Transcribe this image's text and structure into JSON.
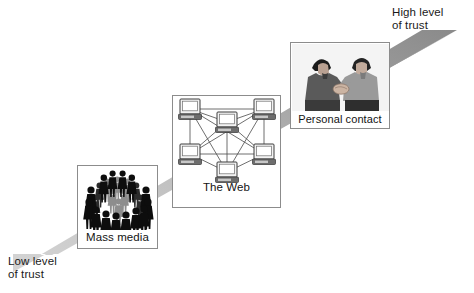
{
  "figure": {
    "type": "conceptual-diagram",
    "background_color": "#ffffff"
  },
  "axis": {
    "low_label": "Low level\nof trust",
    "high_label": "High level\nof trust",
    "direction": "diagonal ascending from lower-left to upper-right",
    "band_color_left": "#c9c9c9",
    "band_color_right": "#8f8f8f"
  },
  "nodes": [
    {
      "id": "mass-media",
      "caption": "Mass media",
      "trust_rank": 1,
      "artwork": "crowd-of-people-silhouettes",
      "art_color": "#111111"
    },
    {
      "id": "the-web",
      "caption": "The Web",
      "trust_rank": 2,
      "artwork": "fully-connected-computer-network",
      "node_count": 6,
      "art_color": "#555555"
    },
    {
      "id": "personal-contact",
      "caption": "Personal contact",
      "trust_rank": 3,
      "artwork": "two-men-shaking-hands",
      "art_color": "#6b6b6b"
    }
  ],
  "panel": {
    "border_color": "#8c8c8c",
    "fill_color": "#ffffff"
  }
}
